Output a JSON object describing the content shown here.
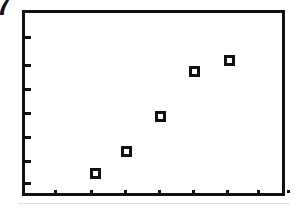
{
  "figure": {
    "corner_label": "7",
    "background_color": "#ffffff",
    "ink_color": "#111111"
  },
  "chart_data": {
    "type": "scatter",
    "title": "",
    "subtitle": "",
    "xlabel": "",
    "ylabel": "",
    "legend": [],
    "grid": false,
    "legend_position": "none",
    "marker_style": "open-square",
    "marker_edge_color": "#111111",
    "marker_face_color": "#ffffff",
    "xlim": [
      0,
      9
    ],
    "ylim": [
      0,
      8
    ],
    "x_tick_labels": [
      "",
      "",
      "",
      "",
      "",
      "",
      "",
      ""
    ],
    "y_tick_labels": [
      "",
      "",
      "",
      "",
      "",
      "",
      ""
    ],
    "x": [
      1.9,
      2.9,
      4.0,
      5.1,
      6.2
    ],
    "y": [
      1.1,
      2.0,
      3.4,
      5.3,
      5.8
    ],
    "points": [
      {
        "x": 1.9,
        "y": 1.1,
        "px": 92,
        "py": 170
      },
      {
        "x": 2.9,
        "y": 2.0,
        "px": 123,
        "py": 148
      },
      {
        "x": 4.0,
        "y": 3.4,
        "px": 157,
        "py": 113
      },
      {
        "x": 5.1,
        "y": 5.3,
        "px": 191,
        "py": 68
      },
      {
        "x": 6.2,
        "y": 5.8,
        "px": 226,
        "py": 57
      }
    ],
    "y_tick_pixels": [
      34,
      62,
      86,
      110,
      134,
      158,
      180
    ],
    "x_tick_pixels": [
      52,
      88,
      122,
      156,
      190,
      224,
      255,
      285
    ]
  }
}
